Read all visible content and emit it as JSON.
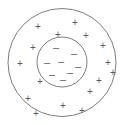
{
  "figure": {
    "width": 126,
    "height": 125,
    "background_color": "#ffffff",
    "stroke_color": "#6e6e70",
    "glyph_color": "#5c5c5e"
  },
  "outer_circle": {
    "name": "outer-boundary",
    "cx": 62,
    "cy": 62.5,
    "r": 54
  },
  "inner_circle": {
    "name": "inner-boundary",
    "cx": 62,
    "cy": 62,
    "r": 25
  },
  "negative_charges": {
    "symbol": "–",
    "label": "negative charge",
    "count": 8,
    "points": [
      {
        "x": 56,
        "y": 47
      },
      {
        "x": 74,
        "y": 53
      },
      {
        "x": 47,
        "y": 62
      },
      {
        "x": 61,
        "y": 61
      },
      {
        "x": 78,
        "y": 66
      },
      {
        "x": 52,
        "y": 74
      },
      {
        "x": 70,
        "y": 72
      },
      {
        "x": 63,
        "y": 79
      }
    ]
  },
  "positive_charges": {
    "symbol": "+",
    "label": "positive charge",
    "count": 16,
    "points": [
      {
        "x": 75,
        "y": 22
      },
      {
        "x": 38,
        "y": 26
      },
      {
        "x": 58,
        "y": 34
      },
      {
        "x": 86,
        "y": 35
      },
      {
        "x": 33,
        "y": 47
      },
      {
        "x": 103,
        "y": 45
      },
      {
        "x": 20,
        "y": 63
      },
      {
        "x": 108,
        "y": 62
      },
      {
        "x": 40,
        "y": 81
      },
      {
        "x": 99,
        "y": 80
      },
      {
        "x": 28,
        "y": 98
      },
      {
        "x": 90,
        "y": 91
      },
      {
        "x": 63,
        "y": 105
      },
      {
        "x": 82,
        "y": 110
      },
      {
        "x": 36,
        "y": 113
      },
      {
        "x": 113,
        "y": 72
      }
    ]
  }
}
